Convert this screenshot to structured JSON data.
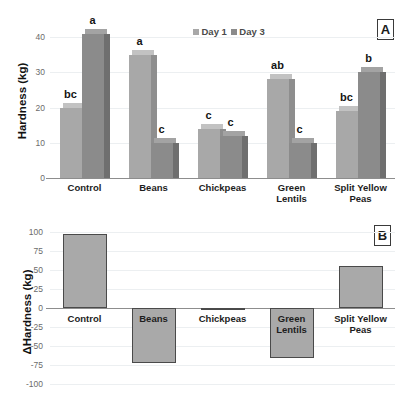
{
  "figure": {
    "panels": [
      {
        "tag": "A"
      },
      {
        "tag": "B"
      }
    ]
  },
  "panel_a": {
    "tag": "A",
    "ylabel": "Hardness (kg)",
    "yticks": [
      "0",
      "10",
      "20",
      "30",
      "40"
    ],
    "legend": [
      {
        "label": "Day 1",
        "color": "#a8a8a8"
      },
      {
        "label": "Day 3",
        "color": "#8b8b8b"
      }
    ],
    "categories": [
      "Control",
      "Beans",
      "Chickpeas",
      "Green\nLentils",
      "Split Yellow\nPeas"
    ],
    "category_labels": [
      [
        "Control"
      ],
      [
        "Beans"
      ],
      [
        "Chickpeas"
      ],
      [
        "Green",
        "Lentils"
      ],
      [
        "Split Yellow",
        "Peas"
      ]
    ],
    "letters_day1": [
      "bc",
      "a",
      "c",
      "ab",
      "bc"
    ],
    "letters_day3": [
      "a",
      "c",
      "c",
      "c",
      "b"
    ]
  },
  "panel_b": {
    "tag": "B",
    "ylabel": "ΔHardness (kg)",
    "yticks": [
      "100",
      "75",
      "50",
      "25",
      "0",
      "-25",
      "-50",
      "-75",
      "-100"
    ],
    "category_labels": [
      [
        "Control"
      ],
      [
        "Beans"
      ],
      [
        "Chickpeas"
      ],
      [
        "Green",
        "Lentils"
      ],
      [
        "Split Yellow",
        "Peas"
      ]
    ]
  },
  "chart_data": [
    {
      "type": "bar",
      "panel": "A",
      "title": "",
      "xlabel": "",
      "ylabel": "Hardness (kg)",
      "ylim": [
        0,
        42
      ],
      "yticks": [
        0,
        10,
        20,
        30,
        40
      ],
      "grid": true,
      "legend_position": "top-center",
      "categories": [
        "Control",
        "Beans",
        "Chickpeas",
        "Green Lentils",
        "Split Yellow Peas"
      ],
      "series": [
        {
          "name": "Day 1",
          "color": "#a8a8a8",
          "values": [
            20,
            35,
            14,
            28,
            19
          ]
        },
        {
          "name": "Day 3",
          "color": "#8b8b8b",
          "values": [
            41,
            10,
            12,
            10,
            30
          ]
        }
      ],
      "annotations": {
        "Day 1": [
          "bc",
          "a",
          "c",
          "ab",
          "bc"
        ],
        "Day 3": [
          "a",
          "c",
          "c",
          "c",
          "b"
        ]
      }
    },
    {
      "type": "bar",
      "panel": "B",
      "title": "",
      "xlabel": "",
      "ylabel": "ΔHardness (kg)",
      "ylim": [
        -100,
        100
      ],
      "yticks": [
        -100,
        -75,
        -50,
        -25,
        0,
        25,
        50,
        75,
        100
      ],
      "grid": true,
      "legend_position": "none",
      "categories": [
        "Control",
        "Beans",
        "Chickpeas",
        "Green Lentils",
        "Split Yellow Peas"
      ],
      "values": [
        98,
        -72,
        -3,
        -66,
        55
      ],
      "bar_color": "#a9a9a9"
    }
  ]
}
